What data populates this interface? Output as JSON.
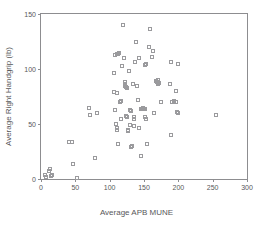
{
  "chart_data": {
    "type": "scatter",
    "title": "",
    "xlabel": "Average APB MUNE",
    "ylabel": "Average Right Handgrip (lb)",
    "xlim": [
      0,
      300
    ],
    "ylim": [
      0,
      150
    ],
    "xticks": [
      0,
      50,
      100,
      150,
      200,
      250,
      300
    ],
    "yticks": [
      0,
      50,
      100,
      150
    ],
    "xtick_labels": [
      "0",
      "50",
      "100",
      "150",
      "200",
      "250",
      "300"
    ],
    "ytick_labels": [
      "0",
      "50",
      "100",
      "150"
    ],
    "grid": false,
    "legend": null,
    "marker": "open-square",
    "marker_color": "#9a9a9d",
    "frame_color": "#8d8d90",
    "text_color": "#58585a",
    "points": [
      [
        6,
        4
      ],
      [
        8,
        2
      ],
      [
        11,
        7
      ],
      [
        13,
        9
      ],
      [
        14,
        3
      ],
      [
        16,
        4
      ],
      [
        41,
        34
      ],
      [
        45,
        34
      ],
      [
        47,
        14
      ],
      [
        52,
        1
      ],
      [
        53,
        1
      ],
      [
        70,
        65
      ],
      [
        71,
        58
      ],
      [
        79,
        19
      ],
      [
        81,
        60
      ],
      [
        106,
        96
      ],
      [
        108,
        113
      ],
      [
        110,
        114
      ],
      [
        112,
        114
      ],
      [
        113,
        115
      ],
      [
        107,
        79
      ],
      [
        110,
        78
      ],
      [
        108,
        63
      ],
      [
        109,
        50
      ],
      [
        110,
        46
      ],
      [
        111,
        45
      ],
      [
        112,
        32
      ],
      [
        115,
        70
      ],
      [
        116,
        71
      ],
      [
        117,
        55
      ],
      [
        118,
        103
      ],
      [
        120,
        140
      ],
      [
        121,
        110
      ],
      [
        122,
        86
      ],
      [
        123,
        88
      ],
      [
        123,
        85
      ],
      [
        124,
        84
      ],
      [
        125,
        83
      ],
      [
        124,
        57
      ],
      [
        125,
        56
      ],
      [
        126,
        45
      ],
      [
        127,
        44
      ],
      [
        128,
        98
      ],
      [
        129,
        49
      ],
      [
        130,
        63
      ],
      [
        131,
        62
      ],
      [
        131,
        29
      ],
      [
        133,
        30
      ],
      [
        134,
        86
      ],
      [
        135,
        55
      ],
      [
        136,
        56
      ],
      [
        136,
        48
      ],
      [
        137,
        106
      ],
      [
        138,
        125
      ],
      [
        140,
        85
      ],
      [
        141,
        72
      ],
      [
        142,
        110
      ],
      [
        143,
        46
      ],
      [
        145,
        21
      ],
      [
        146,
        64
      ],
      [
        147,
        64
      ],
      [
        148,
        65
      ],
      [
        149,
        64
      ],
      [
        150,
        64
      ],
      [
        151,
        64
      ],
      [
        152,
        104
      ],
      [
        153,
        105
      ],
      [
        152,
        56
      ],
      [
        153,
        55
      ],
      [
        155,
        32
      ],
      [
        157,
        120
      ],
      [
        159,
        136
      ],
      [
        161,
        111
      ],
      [
        163,
        116
      ],
      [
        164,
        60
      ],
      [
        168,
        89
      ],
      [
        169,
        88
      ],
      [
        170,
        90
      ],
      [
        171,
        86
      ],
      [
        172,
        87
      ],
      [
        175,
        70
      ],
      [
        188,
        86
      ],
      [
        189,
        40
      ],
      [
        190,
        106
      ],
      [
        191,
        70
      ],
      [
        193,
        71
      ],
      [
        196,
        70
      ],
      [
        197,
        80
      ],
      [
        198,
        61
      ],
      [
        199,
        60
      ],
      [
        199,
        105
      ],
      [
        255,
        58
      ]
    ]
  }
}
